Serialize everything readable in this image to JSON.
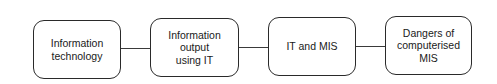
{
  "diagram": {
    "type": "flowchart",
    "direction": "left-to-right",
    "nodes": [
      {
        "id": "n1",
        "label": "Information\ntechnology"
      },
      {
        "id": "n2",
        "label": "Information\noutput\nusing IT"
      },
      {
        "id": "n3",
        "label": "IT and MIS"
      },
      {
        "id": "n4",
        "label": "Dangers of\ncomputerised\nMIS"
      }
    ],
    "edges": [
      {
        "from": "n1",
        "to": "n2"
      },
      {
        "from": "n2",
        "to": "n3"
      },
      {
        "from": "n3",
        "to": "n4"
      }
    ]
  }
}
